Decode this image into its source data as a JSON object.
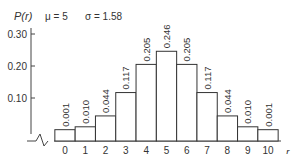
{
  "chart_data": {
    "type": "bar",
    "title": "",
    "ylabel": "P(r)",
    "xlabel": "r",
    "annotations": {
      "mu": "μ = 5",
      "sigma": "σ = 1.58"
    },
    "categories": [
      "0",
      "1",
      "2",
      "3",
      "4",
      "5",
      "6",
      "7",
      "8",
      "9",
      "10"
    ],
    "values": [
      0.001,
      0.01,
      0.044,
      0.117,
      0.205,
      0.246,
      0.205,
      0.117,
      0.044,
      0.01,
      0.001
    ],
    "value_labels": [
      "0.001",
      "0.010",
      "0.044",
      "0.117",
      "0.205",
      "0.246",
      "0.205",
      "0.117",
      "0.044",
      "0.010",
      "0.001"
    ],
    "yticks": [
      {
        "value": 0.1,
        "label": "0.10"
      },
      {
        "value": 0.2,
        "label": "0.20"
      },
      {
        "value": 0.3,
        "label": "0.30"
      }
    ],
    "ylim": [
      0,
      0.33
    ],
    "grid": false,
    "legend": "none",
    "colors": {
      "bar_fill": "#ffffff",
      "bar_stroke": "#333333",
      "axis": "#444444",
      "text": "#333333"
    }
  }
}
